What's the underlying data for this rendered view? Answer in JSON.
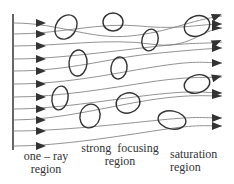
{
  "diagram": {
    "type": "ray-propagation-through-random-lenses",
    "colors": {
      "ink": "#333333",
      "ray": "#777777",
      "background": "#ffffff"
    },
    "labels": [
      {
        "id": "one-ray",
        "line1": "one – ray",
        "line2": "region"
      },
      {
        "id": "strong-focusing",
        "line1": "strong  focusing",
        "line2": "region"
      },
      {
        "id": "saturation",
        "line1": "saturation",
        "line2": "region"
      }
    ],
    "input_arrows_y": [
      23,
      34,
      46,
      59,
      71,
      84,
      97,
      109,
      120,
      131,
      146
    ],
    "output_arrows_y": [
      16,
      24,
      28,
      42,
      48,
      63,
      77,
      93,
      96,
      118,
      126
    ],
    "blobs": [
      {
        "cx": 66,
        "cy": 27,
        "rx": 10,
        "ry": 13,
        "rot": 35
      },
      {
        "cx": 113,
        "cy": 22,
        "rx": 10,
        "ry": 9,
        "rot": 0
      },
      {
        "cx": 150,
        "cy": 40,
        "rx": 8,
        "ry": 11,
        "rot": 15
      },
      {
        "cx": 78,
        "cy": 63,
        "rx": 9,
        "ry": 13,
        "rot": 5
      },
      {
        "cx": 119,
        "cy": 68,
        "rx": 8,
        "ry": 11,
        "rot": 10
      },
      {
        "cx": 197,
        "cy": 26,
        "rx": 13,
        "ry": 10,
        "rot": -20
      },
      {
        "cx": 60,
        "cy": 98,
        "rx": 8,
        "ry": 12,
        "rot": 10
      },
      {
        "cx": 90,
        "cy": 116,
        "rx": 10,
        "ry": 12,
        "rot": 15
      },
      {
        "cx": 128,
        "cy": 103,
        "rx": 12,
        "ry": 10,
        "rot": -15
      },
      {
        "cx": 197,
        "cy": 84,
        "rx": 13,
        "ry": 9,
        "rot": -15
      },
      {
        "cx": 172,
        "cy": 120,
        "rx": 14,
        "ry": 9,
        "rot": 10
      }
    ]
  }
}
